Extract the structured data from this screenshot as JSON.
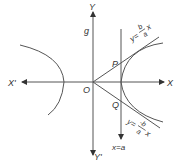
{
  "diagram": {
    "type": "hyperbola-with-asymptotes",
    "stroke_color": "#444444",
    "labels": {
      "x_pos": "X",
      "x_neg": "X'",
      "y_pos": "Y",
      "y_neg": "Y'",
      "origin": "O",
      "point_p": "P",
      "point_q": "Q",
      "g_label": "g",
      "directrix": "x=a",
      "asymptote_pos_lhs": "y=",
      "asymptote_pos_num": "b",
      "asymptote_pos_den": "a",
      "asymptote_pos_var": "x",
      "asymptote_neg_lhs": "y=",
      "asymptote_neg_num": "-b",
      "asymptote_neg_den": "a",
      "asymptote_neg_var": "x"
    }
  }
}
